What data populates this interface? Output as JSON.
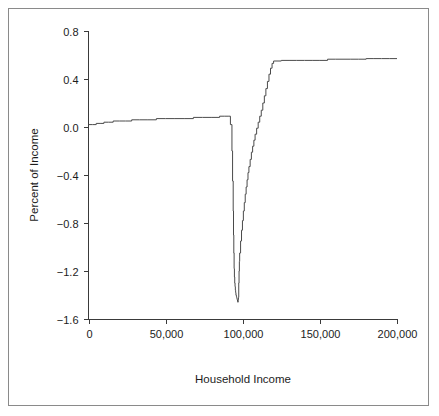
{
  "chart_data": {
    "type": "line",
    "title": "",
    "xlabel": "Household Income",
    "ylabel": "Percent of Income",
    "xlim": [
      0,
      200000
    ],
    "ylim": [
      -1.6,
      0.8
    ],
    "grid": false,
    "legend": null,
    "xticks": [
      0,
      50000,
      100000,
      150000,
      200000
    ],
    "xtick_labels": [
      "0",
      "50,000",
      "100,000",
      "150,000",
      "200,000"
    ],
    "yticks": [
      -1.6,
      -1.2,
      -0.8,
      -0.4,
      0.0,
      0.4,
      0.8
    ],
    "ytick_labels": [
      "-1.6",
      "-1.2",
      "-0.8",
      "-0.4",
      "0.0",
      "0.4",
      "0.8"
    ],
    "line_color": "#4a4a4a",
    "series": [
      {
        "name": "Percent of Income",
        "x": [
          0,
          2500,
          5000,
          7500,
          10000,
          13000,
          16000,
          20000,
          24000,
          28000,
          33000,
          38000,
          44000,
          50000,
          56000,
          62000,
          68000,
          74000,
          80000,
          85000,
          88000,
          90500,
          92000,
          93000,
          93400,
          93800,
          94000,
          94200,
          94400,
          94600,
          94800,
          95000,
          95200,
          95400,
          95600,
          95800,
          96000,
          96200,
          96400,
          96600,
          96800,
          97000,
          97200,
          97400,
          97600,
          97800,
          98000,
          98600,
          99200,
          99800,
          100400,
          101000,
          101600,
          102200,
          102800,
          103400,
          104000,
          104800,
          105600,
          106400,
          107200,
          108000,
          109000,
          110000,
          111000,
          112000,
          113000,
          114000,
          115000,
          116000,
          117000,
          118000,
          119000,
          120000,
          125000,
          130000,
          135000,
          140000,
          145000,
          150000,
          155000,
          160000,
          165000,
          170000,
          175000,
          180000,
          185000,
          190000,
          195000,
          200000
        ],
        "y": [
          0.02,
          0.02,
          0.03,
          0.03,
          0.04,
          0.04,
          0.05,
          0.05,
          0.05,
          0.06,
          0.06,
          0.06,
          0.07,
          0.07,
          0.07,
          0.07,
          0.08,
          0.08,
          0.08,
          0.09,
          0.09,
          0.09,
          0.02,
          -0.2,
          -0.45,
          -0.7,
          -0.9,
          -1.05,
          -1.18,
          -1.25,
          -1.3,
          -1.33,
          -1.36,
          -1.38,
          -1.4,
          -1.41,
          -1.42,
          -1.43,
          -1.44,
          -1.45,
          -1.46,
          -1.44,
          -1.42,
          -1.3,
          -1.2,
          -1.12,
          -1.05,
          -0.95,
          -0.86,
          -0.78,
          -0.7,
          -0.63,
          -0.56,
          -0.5,
          -0.44,
          -0.38,
          -0.33,
          -0.27,
          -0.21,
          -0.16,
          -0.11,
          -0.06,
          -0.01,
          0.04,
          0.09,
          0.14,
          0.2,
          0.26,
          0.32,
          0.38,
          0.44,
          0.49,
          0.53,
          0.55,
          0.555,
          0.555,
          0.555,
          0.555,
          0.555,
          0.555,
          0.565,
          0.565,
          0.565,
          0.565,
          0.565,
          0.57,
          0.57,
          0.57,
          0.57,
          0.57
        ]
      }
    ]
  }
}
